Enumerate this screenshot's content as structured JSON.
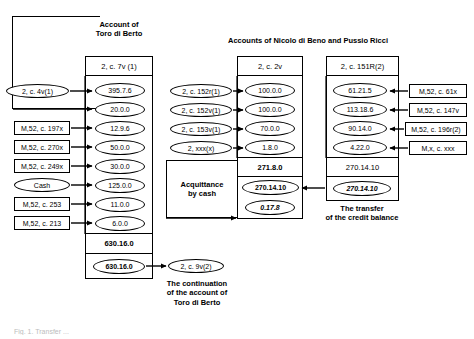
{
  "figure": {
    "bottom_caption": "Fig. 1.  Transfer ..."
  },
  "left_account": {
    "title": "Account of\nToro di Berto",
    "header": "2, c. 7v (1)",
    "entries": [
      {
        "source": "2, c. 4v(1)",
        "source_shape": "ellipse",
        "amount": "395.7.6"
      },
      {
        "source": "",
        "source_shape": "none",
        "amount": "20.0.0"
      },
      {
        "source": "M,52, c. 197x",
        "source_shape": "rect",
        "amount": "12.9.6"
      },
      {
        "source": "M,52, c. 270x",
        "source_shape": "rect",
        "amount": "50.0.0"
      },
      {
        "source": "M,52, c. 249x",
        "source_shape": "rect",
        "amount": "30.0.0"
      },
      {
        "source": "Cash",
        "source_shape": "ellipse",
        "amount": "125.0.0"
      },
      {
        "source": "M,52, c. 253",
        "source_shape": "rect",
        "amount": "11.0.0"
      },
      {
        "source": "M,52, c. 213",
        "source_shape": "rect",
        "amount": "6.0.0"
      }
    ],
    "total": "630.16.0",
    "carried": "630.16.0",
    "target_ref": "2, c. 9v(2)",
    "target_caption": "The continuation\nof the account of\nToro di Berto"
  },
  "middle_account": {
    "title": "Accounts of Nicolo di Beno and Pussio Ricci",
    "header": "2, c. 2v",
    "entries": [
      {
        "source": "2, c. 152r(1)",
        "amount": "100.0.0"
      },
      {
        "source": "2, c.  152v(1)",
        "amount": "100.0.0"
      },
      {
        "source": "2, c. 153v(1)",
        "amount": "70.0.0"
      },
      {
        "source": "2, xxx(x)",
        "amount": "1.8.0"
      }
    ],
    "total": "271.8.0",
    "settled": "270.14.10",
    "remainder": "0.17.8",
    "note": "Acquittance\nby cash"
  },
  "right_account": {
    "header": "2, c. 151R(2)",
    "entries": [
      {
        "amount": "61.21.5",
        "source": "M,52, c. 61x"
      },
      {
        "amount": "113.18.6",
        "source": "M,52, c. 147v"
      },
      {
        "amount": "90.14.0",
        "source": "M,52, c. 196r(2)"
      },
      {
        "amount": "4.22.0",
        "source": "M,x, c. xxx"
      }
    ],
    "total": "270.14.10",
    "transfer": "270.14.10",
    "caption": "The transfer\nof the credit balance"
  }
}
